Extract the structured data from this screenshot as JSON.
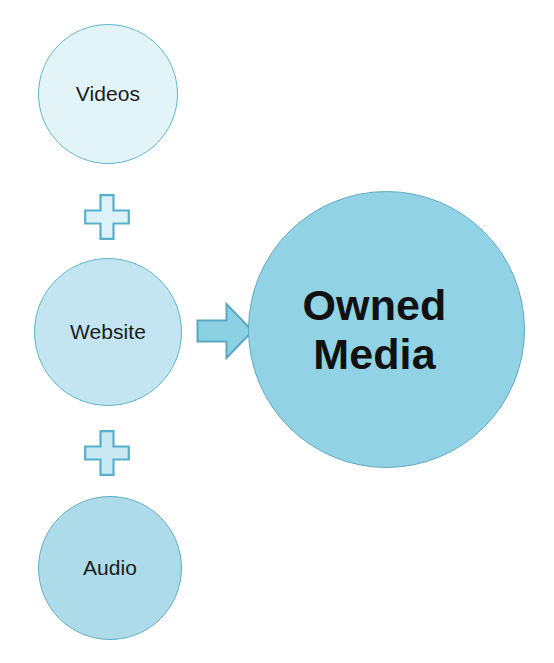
{
  "diagram": {
    "type": "additive-flow",
    "background_color": "#ffffff",
    "sources": [
      {
        "id": "videos",
        "label": "Videos",
        "shape": "circle",
        "fill_color": "#e3f4f8",
        "stroke_color": "#5fb6cf"
      },
      {
        "id": "website",
        "label": "Website",
        "shape": "circle",
        "fill_color": "#c2e5f1",
        "stroke_color": "#61b3cc"
      },
      {
        "id": "audio",
        "label": "Audio",
        "shape": "circle",
        "fill_color": "#addbe9",
        "stroke_color": "#63aec6"
      }
    ],
    "operators": [
      {
        "id": "plus-1",
        "symbol": "plus",
        "fill_color": "#ddf2f8",
        "stroke_color": "#56b0cb"
      },
      {
        "id": "plus-2",
        "symbol": "plus",
        "fill_color": "#c8e8f2",
        "stroke_color": "#56b0cb"
      }
    ],
    "connector": {
      "id": "arrow-right",
      "symbol": "block-arrow-right",
      "fill_color": "#8cd0e4",
      "stroke_color": "#5aa7c1"
    },
    "result": {
      "id": "owned-media",
      "label_line_1": "Owned",
      "label_line_2": "Media",
      "shape": "circle",
      "fill_color": "#92d2e5",
      "stroke_color": "#5fa9c2",
      "text_color": "#111111"
    }
  }
}
